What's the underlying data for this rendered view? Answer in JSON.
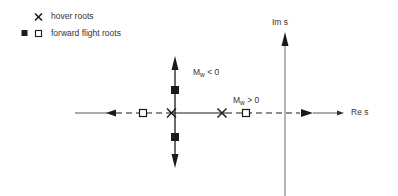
{
  "legend": {
    "items": [
      {
        "symbol": "cross",
        "label": "hover roots"
      },
      {
        "symbol": "filled-square+open-square",
        "label": "forward flight roots"
      }
    ]
  },
  "axes": {
    "real_label": "Re s",
    "imag_label": "Im s"
  },
  "annotations": {
    "mw_negative": {
      "symbol": "M",
      "sub": "w",
      "relation": "< 0"
    },
    "mw_positive": {
      "symbol": "M",
      "sub": "w",
      "relation": "> 0"
    }
  },
  "colors": {
    "ink": "#1a1a1a",
    "axis": "#555555",
    "background": "#ffffff"
  }
}
